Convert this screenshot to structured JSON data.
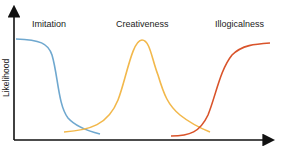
{
  "diagram": {
    "y_axis_label": "Likelihood",
    "x_axis_label": "",
    "curves": [
      {
        "name": "Imitation",
        "color": "#6fa8cf",
        "shape": "decreasing sigmoid"
      },
      {
        "name": "Creativeness",
        "color": "#f2b84b",
        "shape": "bell"
      },
      {
        "name": "Illogicalness",
        "color": "#d9532a",
        "shape": "increasing sigmoid"
      }
    ],
    "axis_color": "#111111"
  }
}
